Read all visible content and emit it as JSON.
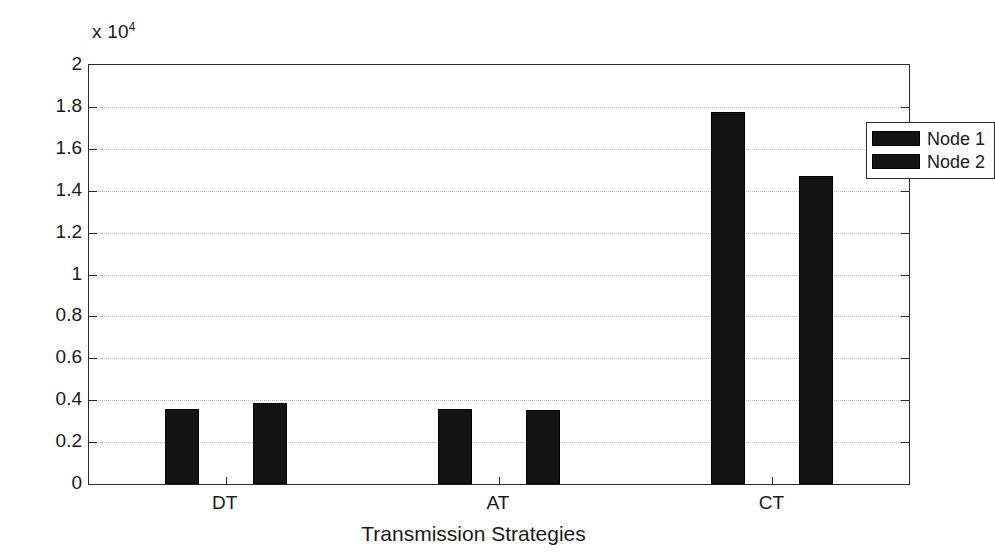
{
  "chart_data": {
    "type": "bar",
    "title": "",
    "categories": [
      "DT",
      "AT",
      "CT"
    ],
    "series": [
      {
        "name": "Node 1",
        "values": [
          3600,
          3600,
          17750
        ],
        "color": "#141414"
      },
      {
        "name": "Node 2",
        "values": [
          3850,
          3550,
          14700
        ],
        "color": "#141414"
      }
    ],
    "xlabel": "Transmission Strategies",
    "ylabel": "Energy Cost (J)",
    "ylim": [
      0,
      20000
    ],
    "y_multiplier_prefix": "x 10",
    "y_multiplier_exponent": "4",
    "y_tick_labels": [
      "0",
      "0.2",
      "0.4",
      "0.6",
      "0.8",
      "1",
      "1.2",
      "1.4",
      "1.6",
      "1.8",
      "2"
    ],
    "y_tick_values": [
      0,
      2000,
      4000,
      6000,
      8000,
      10000,
      12000,
      14000,
      16000,
      18000,
      20000
    ],
    "grid": true,
    "grid_style": "dotted",
    "legend_position": "top-right",
    "legend_entries": [
      "Node 1",
      "Node 2"
    ],
    "axis_color": "#2b2b2b",
    "grid_color": "#b9b9b9",
    "background": "#ffffff"
  },
  "figure": {
    "y_axis_title": "Energy Cost (J)",
    "x_axis_title": "Transmission Strategies"
  }
}
